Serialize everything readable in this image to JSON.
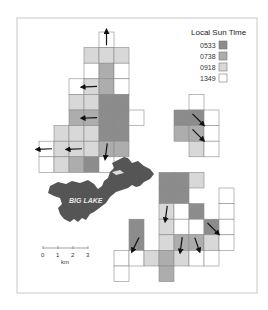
{
  "map": {
    "legend": {
      "title": "Local Sun Time",
      "classes": [
        {
          "key": "dark",
          "label": "0533",
          "color": "#8c8c8c"
        },
        {
          "key": "medium",
          "label": "0738",
          "color": "#adadad"
        },
        {
          "key": "light",
          "label": "0918",
          "color": "#d8d8d8"
        },
        {
          "key": "white",
          "label": "1349",
          "color": "#ffffff"
        }
      ]
    },
    "lake": {
      "label": "BIG LAKE",
      "color": "#555555"
    },
    "scale_bar": {
      "ticks": [
        "0",
        "1",
        "2",
        "3"
      ],
      "unit": "km"
    },
    "clusters": [
      {
        "name": "northwest",
        "cells": [
          {
            "c": 4,
            "r": 0,
            "v": "white",
            "arrow": "up"
          },
          {
            "c": 3,
            "r": 1,
            "v": "light"
          },
          {
            "c": 4,
            "r": 1,
            "v": "light"
          },
          {
            "c": 5,
            "r": 1,
            "v": "light"
          },
          {
            "c": 3,
            "r": 2,
            "v": "white"
          },
          {
            "c": 4,
            "r": 2,
            "v": "medium"
          },
          {
            "c": 5,
            "r": 2,
            "v": "white"
          },
          {
            "c": 2,
            "r": 3,
            "v": "white"
          },
          {
            "c": 3,
            "r": 3,
            "v": "light",
            "arrow": "left"
          },
          {
            "c": 4,
            "r": 3,
            "v": "medium"
          },
          {
            "c": 5,
            "r": 3,
            "v": "white"
          },
          {
            "c": 2,
            "r": 4,
            "v": "light"
          },
          {
            "c": 3,
            "r": 4,
            "v": "light"
          },
          {
            "c": 4,
            "r": 4,
            "v": "dark"
          },
          {
            "c": 5,
            "r": 4,
            "v": "dark"
          },
          {
            "c": 2,
            "r": 5,
            "v": "medium"
          },
          {
            "c": 3,
            "r": 5,
            "v": "medium",
            "arrow": "left"
          },
          {
            "c": 4,
            "r": 5,
            "v": "dark"
          },
          {
            "c": 5,
            "r": 5,
            "v": "dark"
          },
          {
            "c": 6,
            "r": 5,
            "v": "white"
          },
          {
            "c": 1,
            "r": 6,
            "v": "light"
          },
          {
            "c": 2,
            "r": 6,
            "v": "light"
          },
          {
            "c": 3,
            "r": 6,
            "v": "light"
          },
          {
            "c": 4,
            "r": 6,
            "v": "dark"
          },
          {
            "c": 5,
            "r": 6,
            "v": "dark"
          },
          {
            "c": 0,
            "r": 7,
            "v": "white",
            "arrow": "left"
          },
          {
            "c": 1,
            "r": 7,
            "v": "light"
          },
          {
            "c": 2,
            "r": 7,
            "v": "light",
            "arrow": "left"
          },
          {
            "c": 3,
            "r": 7,
            "v": "light"
          },
          {
            "c": 4,
            "r": 7,
            "v": "medium",
            "arrow": "down"
          },
          {
            "c": 5,
            "r": 7,
            "v": "medium"
          },
          {
            "c": 0,
            "r": 8,
            "v": "white"
          },
          {
            "c": 1,
            "r": 8,
            "v": "light"
          },
          {
            "c": 2,
            "r": 8,
            "v": "medium"
          },
          {
            "c": 3,
            "r": 8,
            "v": "dark"
          },
          {
            "c": 4,
            "r": 8,
            "v": "white"
          }
        ]
      },
      {
        "name": "northeast",
        "cells": [
          {
            "c": 10,
            "r": 4,
            "v": "white"
          },
          {
            "c": 9,
            "r": 5,
            "v": "dark"
          },
          {
            "c": 10,
            "r": 5,
            "v": "dark",
            "arrow": "down-right"
          },
          {
            "c": 11,
            "r": 5,
            "v": "white"
          },
          {
            "c": 9,
            "r": 6,
            "v": "medium"
          },
          {
            "c": 10,
            "r": 6,
            "v": "medium",
            "arrow": "down-right"
          },
          {
            "c": 11,
            "r": 6,
            "v": "white"
          },
          {
            "c": 10,
            "r": 7,
            "v": "light"
          },
          {
            "c": 11,
            "r": 7,
            "v": "white"
          }
        ]
      },
      {
        "name": "southeast",
        "cells": [
          {
            "c": 8,
            "r": 9,
            "v": "dark"
          },
          {
            "c": 9,
            "r": 9,
            "v": "dark"
          },
          {
            "c": 10,
            "r": 9,
            "v": "light"
          },
          {
            "c": 8,
            "r": 10,
            "v": "dark"
          },
          {
            "c": 9,
            "r": 10,
            "v": "dark"
          },
          {
            "c": 12,
            "r": 10,
            "v": "white"
          },
          {
            "c": 8,
            "r": 11,
            "v": "light",
            "arrow": "down"
          },
          {
            "c": 9,
            "r": 11,
            "v": "white"
          },
          {
            "c": 10,
            "r": 11,
            "v": "dark"
          },
          {
            "c": 12,
            "r": 11,
            "v": "white"
          },
          {
            "c": 6,
            "r": 12,
            "v": "dark"
          },
          {
            "c": 8,
            "r": 12,
            "v": "light"
          },
          {
            "c": 9,
            "r": 12,
            "v": "white"
          },
          {
            "c": 10,
            "r": 12,
            "v": "white"
          },
          {
            "c": 11,
            "r": 12,
            "v": "dark",
            "arrow": "down-right"
          },
          {
            "c": 12,
            "r": 12,
            "v": "white"
          },
          {
            "c": 6,
            "r": 13,
            "v": "dark",
            "arrow": "down-left"
          },
          {
            "c": 8,
            "r": 13,
            "v": "light"
          },
          {
            "c": 9,
            "r": 13,
            "v": "medium",
            "arrow": "down"
          },
          {
            "c": 10,
            "r": 13,
            "v": "medium",
            "arrow": "down-slight"
          },
          {
            "c": 11,
            "r": 13,
            "v": "light"
          },
          {
            "c": 12,
            "r": 13,
            "v": "white"
          },
          {
            "c": 5,
            "r": 14,
            "v": "white"
          },
          {
            "c": 6,
            "r": 14,
            "v": "white"
          },
          {
            "c": 7,
            "r": 14,
            "v": "light"
          },
          {
            "c": 8,
            "r": 14,
            "v": "medium"
          },
          {
            "c": 9,
            "r": 14,
            "v": "light"
          },
          {
            "c": 10,
            "r": 14,
            "v": "white"
          },
          {
            "c": 11,
            "r": 14,
            "v": "white"
          },
          {
            "c": 5,
            "r": 15,
            "v": "white"
          },
          {
            "c": 8,
            "r": 15,
            "v": "medium"
          }
        ]
      }
    ]
  }
}
